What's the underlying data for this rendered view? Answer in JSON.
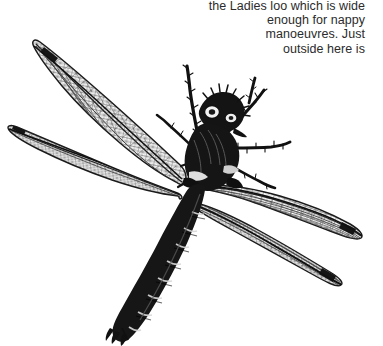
{
  "page": {
    "background_color": "#ffffff",
    "width": 383,
    "height": 346
  },
  "caption": {
    "alignment": "right",
    "text_color": "#2b2b2b",
    "full_text": "the Ladies loo which is wide enough for nappy manoeuvres. Just outside here is",
    "lines": [
      "the Ladies loo which is wide",
      "enough for nappy",
      "manoeuvres. Just",
      "outside here is"
    ]
  },
  "illustration": {
    "name": "dragonfly-engraving",
    "subject": "dragonfly",
    "style": "black-and-white line engraving",
    "ink_color": "#111111",
    "vein_color": "#3a3a3a",
    "wing_fill": "#fbfbfb",
    "parts": [
      {
        "name": "upper-left-wing",
        "label": "Upper left forewing"
      },
      {
        "name": "lower-left-wing",
        "label": "Lower left hindwing"
      },
      {
        "name": "upper-right-wing",
        "label": "Upper right forewing"
      },
      {
        "name": "lower-right-wing",
        "label": "Lower right hindwing"
      },
      {
        "name": "head",
        "label": "Head with compound eyes"
      },
      {
        "name": "thorax",
        "label": "Thorax"
      },
      {
        "name": "abdomen",
        "label": "Segmented abdomen"
      },
      {
        "name": "cerci",
        "label": "Terminal appendages"
      },
      {
        "name": "legs",
        "label": "Spined legs"
      }
    ]
  }
}
